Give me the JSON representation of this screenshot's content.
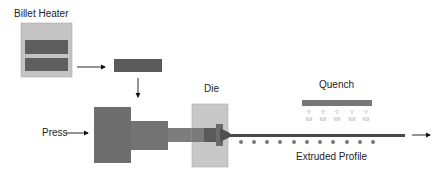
{
  "labels": {
    "billet_heater": "Billet Heater",
    "die": "Die",
    "quench": "Quench",
    "press": "Press",
    "extruded_profile": "Extruded Profile"
  },
  "colors": {
    "heater_body": "#c4c4c4",
    "heater_element": "#5e5e5e",
    "billet": "#5a5a5a",
    "press_ram": "#6e6e6e",
    "stem": "#7d7d7d",
    "die_block": "#c8c8c8",
    "die_insert": "#585858",
    "profile": "#4a4a4a",
    "roller": "#7a7a7a",
    "quench_bar": "#777777",
    "spray": "#b0b0b0",
    "arrow": "#111111"
  },
  "rollers_count": 11,
  "spray_nozzles_count": 5
}
